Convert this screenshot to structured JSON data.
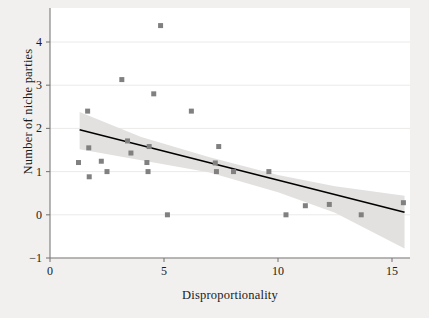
{
  "chart_data": {
    "type": "scatter",
    "title": "",
    "xlabel": "Disproportionality",
    "ylabel": "Number of niche parties",
    "xlim": [
      0,
      15.8
    ],
    "ylim": [
      -1,
      4.45
    ],
    "xticks": [
      0,
      5,
      10,
      15
    ],
    "xtick_labels": [
      "0",
      "5",
      "10",
      "15"
    ],
    "yticks": [
      -1,
      0,
      1,
      2,
      3,
      4
    ],
    "ytick_labels": [
      "−1",
      "0",
      "1",
      "2",
      "3",
      "4"
    ],
    "grid": "horizontal",
    "legend": "none",
    "marker": "square",
    "marker_color": "#808080",
    "marker_size": 5,
    "points": [
      {
        "x": 1.25,
        "y": 1.21
      },
      {
        "x": 1.65,
        "y": 2.4
      },
      {
        "x": 1.7,
        "y": 1.55
      },
      {
        "x": 1.72,
        "y": 0.88
      },
      {
        "x": 2.25,
        "y": 1.24
      },
      {
        "x": 2.5,
        "y": 1.0
      },
      {
        "x": 3.15,
        "y": 3.13
      },
      {
        "x": 3.4,
        "y": 1.71
      },
      {
        "x": 3.55,
        "y": 1.43
      },
      {
        "x": 4.25,
        "y": 1.21
      },
      {
        "x": 4.3,
        "y": 1.0
      },
      {
        "x": 4.35,
        "y": 1.58
      },
      {
        "x": 4.55,
        "y": 2.8
      },
      {
        "x": 4.85,
        "y": 4.38
      },
      {
        "x": 5.15,
        "y": 0.0
      },
      {
        "x": 6.2,
        "y": 2.4
      },
      {
        "x": 7.25,
        "y": 1.2
      },
      {
        "x": 7.3,
        "y": 1.0
      },
      {
        "x": 7.4,
        "y": 1.58
      },
      {
        "x": 8.05,
        "y": 1.0
      },
      {
        "x": 9.6,
        "y": 1.0
      },
      {
        "x": 10.35,
        "y": 0.0
      },
      {
        "x": 11.2,
        "y": 0.21
      },
      {
        "x": 12.25,
        "y": 0.24
      },
      {
        "x": 13.65,
        "y": 0.0
      },
      {
        "x": 15.5,
        "y": 0.28
      }
    ],
    "fit_line": {
      "type": "linear",
      "color": "#000000",
      "x_start": 1.3,
      "y_start": 1.97,
      "x_end": 15.55,
      "y_end": 0.06
    },
    "confidence_band": {
      "color": "#e2e1df",
      "upper": [
        {
          "x": 1.3,
          "y": 2.38
        },
        {
          "x": 4.0,
          "y": 1.8
        },
        {
          "x": 7.0,
          "y": 1.33
        },
        {
          "x": 10.0,
          "y": 0.92
        },
        {
          "x": 12.5,
          "y": 0.66
        },
        {
          "x": 15.55,
          "y": 0.44
        }
      ],
      "lower": [
        {
          "x": 1.3,
          "y": 1.52
        },
        {
          "x": 4.0,
          "y": 1.26
        },
        {
          "x": 7.0,
          "y": 0.98
        },
        {
          "x": 10.0,
          "y": 0.52
        },
        {
          "x": 12.5,
          "y": 0.05
        },
        {
          "x": 15.55,
          "y": -0.78
        }
      ]
    }
  }
}
